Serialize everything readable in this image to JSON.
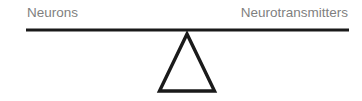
{
  "diagram": {
    "type": "balance-scale",
    "left_label": "Neurons",
    "right_label": "Neurotransmitters",
    "colors": {
      "label_text": "#7f7f7f",
      "beam": "#1a1a1a",
      "fulcrum": "#1a1a1a",
      "background": "#ffffff"
    }
  }
}
